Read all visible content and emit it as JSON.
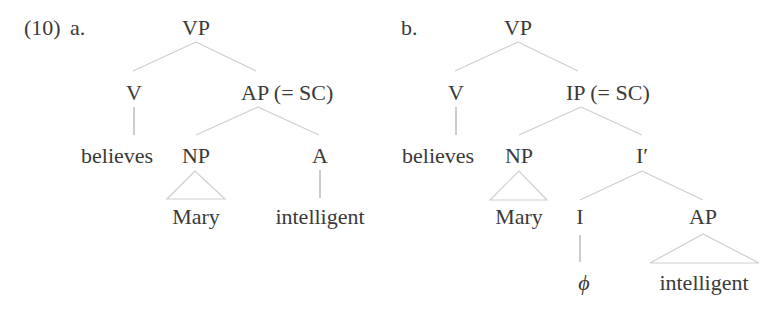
{
  "example_number": "(10)",
  "trees": [
    {
      "label": "a.",
      "root": "VP",
      "nodes": {
        "vp": "VP",
        "v": "V",
        "ap": "AP (= SC)",
        "believes": "believes",
        "np": "NP",
        "a": "A",
        "mary": "Mary",
        "intelligent": "intelligent"
      },
      "structure": "[VP [V believes] [AP(=SC) [NP Mary] [A intelligent]]]"
    },
    {
      "label": "b.",
      "root": "VP",
      "nodes": {
        "vp": "VP",
        "v": "V",
        "ip": "IP (= SC)",
        "believes": "believes",
        "np": "NP",
        "ibar": "I′",
        "mary": "Mary",
        "i": "I",
        "ap": "AP",
        "phi": "ϕ",
        "intelligent": "intelligent"
      },
      "structure": "[VP [V believes] [IP(=SC) [NP Mary] [I' [I ϕ] [AP intelligent]]]]"
    }
  ],
  "colors": {
    "text": "#3a3a3a",
    "branch": "#cfcfcf",
    "stem": "#9a9a9a"
  }
}
